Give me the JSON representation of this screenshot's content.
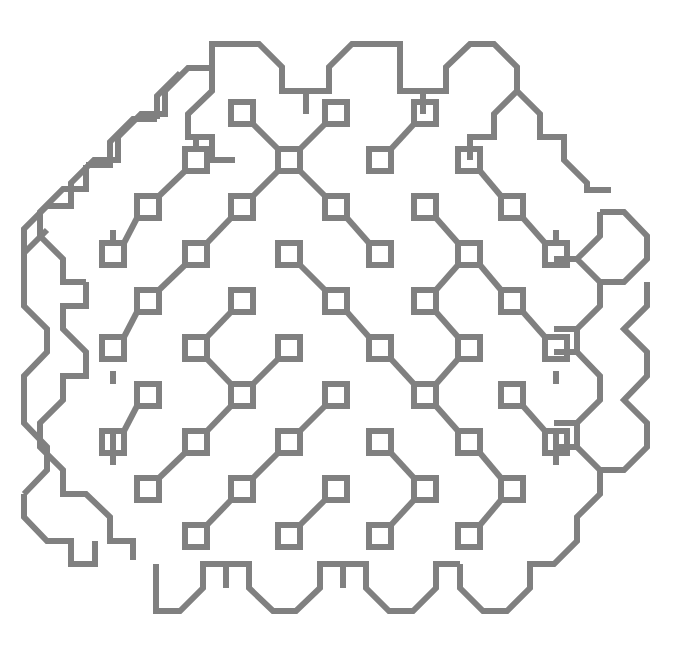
{
  "artwork": {
    "title": "Generative Square-Node Lattice Pattern",
    "type": "vector-line-art",
    "background_color": "#ffffff",
    "stroke_color": "#808080",
    "stroke_width": 6,
    "stroke_linecap": "butt",
    "stroke_linejoin": "miter",
    "canvas": {
      "width": 680,
      "height": 659
    },
    "lattice": {
      "description": "Diagonal (checkerboard) lattice of open squares joined by 45-degree and axis-aligned connector segments, enclosed by an octagonal battlement contour.",
      "node_pitch_x": 94,
      "node_pitch_y": 94,
      "half_pitch": 47,
      "node_square_size": 22,
      "origin_x": 54,
      "origin_y": 42
    },
    "node_squares": [
      [
        242,
        113
      ],
      [
        336,
        113
      ],
      [
        425,
        113
      ],
      [
        196,
        160
      ],
      [
        289,
        160
      ],
      [
        380,
        160
      ],
      [
        469,
        160
      ],
      [
        148,
        207
      ],
      [
        242,
        207
      ],
      [
        336,
        207
      ],
      [
        425,
        207
      ],
      [
        512,
        207
      ],
      [
        113,
        254
      ],
      [
        196,
        254
      ],
      [
        289,
        254
      ],
      [
        380,
        254
      ],
      [
        469,
        254
      ],
      [
        556,
        254
      ],
      [
        148,
        301
      ],
      [
        242,
        301
      ],
      [
        336,
        301
      ],
      [
        425,
        301
      ],
      [
        512,
        301
      ],
      [
        113,
        348
      ],
      [
        196,
        348
      ],
      [
        289,
        348
      ],
      [
        380,
        348
      ],
      [
        469,
        348
      ],
      [
        556,
        348
      ],
      [
        148,
        395
      ],
      [
        242,
        395
      ],
      [
        336,
        395
      ],
      [
        425,
        395
      ],
      [
        512,
        395
      ],
      [
        113,
        442
      ],
      [
        196,
        442
      ],
      [
        289,
        442
      ],
      [
        380,
        442
      ],
      [
        469,
        442
      ],
      [
        556,
        442
      ],
      [
        148,
        489
      ],
      [
        242,
        489
      ],
      [
        336,
        489
      ],
      [
        425,
        489
      ],
      [
        512,
        489
      ],
      [
        196,
        536
      ],
      [
        289,
        536
      ],
      [
        380,
        536
      ],
      [
        469,
        536
      ]
    ],
    "connectors": [
      {
        "from": [
          242,
          113
        ],
        "to": [
          289,
          160
        ],
        "kind": "diagonal"
      },
      {
        "from": [
          336,
          113
        ],
        "to": [
          289,
          160
        ],
        "kind": "diagonal"
      },
      {
        "from": [
          425,
          113
        ],
        "to": [
          380,
          160
        ],
        "kind": "diagonal"
      },
      {
        "from": [
          196,
          160
        ],
        "to": [
          148,
          207
        ],
        "kind": "diagonal"
      },
      {
        "from": [
          289,
          160
        ],
        "to": [
          242,
          207
        ],
        "kind": "diagonal"
      },
      {
        "from": [
          289,
          160
        ],
        "to": [
          336,
          207
        ],
        "kind": "diagonal"
      },
      {
        "from": [
          469,
          160
        ],
        "to": [
          512,
          207
        ],
        "kind": "diagonal"
      },
      {
        "from": [
          148,
          207
        ],
        "to": [
          113,
          254
        ],
        "kind": "diagonal"
      },
      {
        "from": [
          242,
          207
        ],
        "to": [
          196,
          254
        ],
        "kind": "diagonal"
      },
      {
        "from": [
          336,
          207
        ],
        "to": [
          380,
          254
        ],
        "kind": "diagonal"
      },
      {
        "from": [
          425,
          207
        ],
        "to": [
          469,
          254
        ],
        "kind": "diagonal"
      },
      {
        "from": [
          512,
          207
        ],
        "to": [
          556,
          254
        ],
        "kind": "diagonal"
      },
      {
        "from": [
          196,
          254
        ],
        "to": [
          148,
          301
        ],
        "kind": "diagonal"
      },
      {
        "from": [
          289,
          254
        ],
        "to": [
          336,
          301
        ],
        "kind": "diagonal"
      },
      {
        "from": [
          469,
          254
        ],
        "to": [
          425,
          301
        ],
        "kind": "diagonal"
      },
      {
        "from": [
          469,
          254
        ],
        "to": [
          512,
          301
        ],
        "kind": "diagonal"
      },
      {
        "from": [
          148,
          301
        ],
        "to": [
          113,
          348
        ],
        "kind": "diagonal"
      },
      {
        "from": [
          242,
          301
        ],
        "to": [
          196,
          348
        ],
        "kind": "diagonal"
      },
      {
        "from": [
          336,
          301
        ],
        "to": [
          380,
          348
        ],
        "kind": "diagonal"
      },
      {
        "from": [
          425,
          301
        ],
        "to": [
          469,
          348
        ],
        "kind": "diagonal"
      },
      {
        "from": [
          512,
          301
        ],
        "to": [
          556,
          348
        ],
        "kind": "diagonal"
      },
      {
        "from": [
          196,
          348
        ],
        "to": [
          242,
          395
        ],
        "kind": "diagonal"
      },
      {
        "from": [
          289,
          348
        ],
        "to": [
          242,
          395
        ],
        "kind": "diagonal"
      },
      {
        "from": [
          380,
          348
        ],
        "to": [
          425,
          395
        ],
        "kind": "diagonal"
      },
      {
        "from": [
          469,
          348
        ],
        "to": [
          425,
          395
        ],
        "kind": "diagonal"
      },
      {
        "from": [
          148,
          395
        ],
        "to": [
          113,
          442
        ],
        "kind": "diagonal"
      },
      {
        "from": [
          242,
          395
        ],
        "to": [
          196,
          442
        ],
        "kind": "diagonal"
      },
      {
        "from": [
          336,
          395
        ],
        "to": [
          289,
          442
        ],
        "kind": "diagonal"
      },
      {
        "from": [
          425,
          395
        ],
        "to": [
          469,
          442
        ],
        "kind": "diagonal"
      },
      {
        "from": [
          512,
          395
        ],
        "to": [
          556,
          442
        ],
        "kind": "diagonal"
      },
      {
        "from": [
          196,
          442
        ],
        "to": [
          148,
          489
        ],
        "kind": "diagonal"
      },
      {
        "from": [
          289,
          442
        ],
        "to": [
          242,
          489
        ],
        "kind": "diagonal"
      },
      {
        "from": [
          380,
          442
        ],
        "to": [
          425,
          489
        ],
        "kind": "diagonal"
      },
      {
        "from": [
          469,
          442
        ],
        "to": [
          512,
          489
        ],
        "kind": "diagonal"
      },
      {
        "from": [
          242,
          489
        ],
        "to": [
          196,
          536
        ],
        "kind": "diagonal"
      },
      {
        "from": [
          336,
          489
        ],
        "to": [
          289,
          536
        ],
        "kind": "diagonal"
      },
      {
        "from": [
          425,
          489
        ],
        "to": [
          380,
          536
        ],
        "kind": "diagonal"
      },
      {
        "from": [
          512,
          489
        ],
        "to": [
          469,
          536
        ],
        "kind": "diagonal"
      }
    ],
    "boundary": {
      "shape": "octagon-battlement",
      "description": "Closed outer contour made of alternating horizontal runs and 45-degree bevels forming crenellations on the top and bottom and octagonal bulges on the left and right."
    },
    "open_endpoints": [
      {
        "x": 133,
        "y": 560,
        "label": "bottom-left-stub"
      },
      {
        "x": 596,
        "y": 190,
        "label": "right-upper-stub"
      },
      {
        "x": 600,
        "y": 212,
        "label": "right-vertical-stub"
      },
      {
        "x": 156,
        "y": 572,
        "label": "bottom-contour-stub"
      }
    ]
  }
}
